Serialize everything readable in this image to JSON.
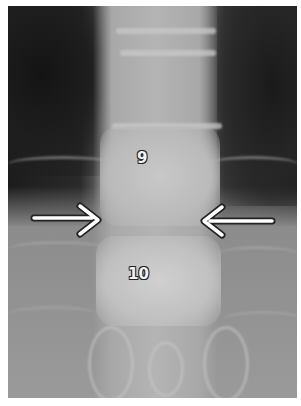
{
  "image": {
    "type": "radiograph",
    "description": "Frontal X-ray of thoracic spine with two arrows pointing at the disc space between labeled vertebrae",
    "background_color": "#ffffff"
  },
  "labels": [
    {
      "id": "vertebra-9",
      "text": "9"
    },
    {
      "id": "vertebra-10",
      "text": "10"
    }
  ],
  "arrows": [
    {
      "id": "left-arrow",
      "direction": "right",
      "color": "#ffffff",
      "outline": "#222222"
    },
    {
      "id": "right-arrow",
      "direction": "left",
      "color": "#ffffff",
      "outline": "#222222"
    }
  ]
}
